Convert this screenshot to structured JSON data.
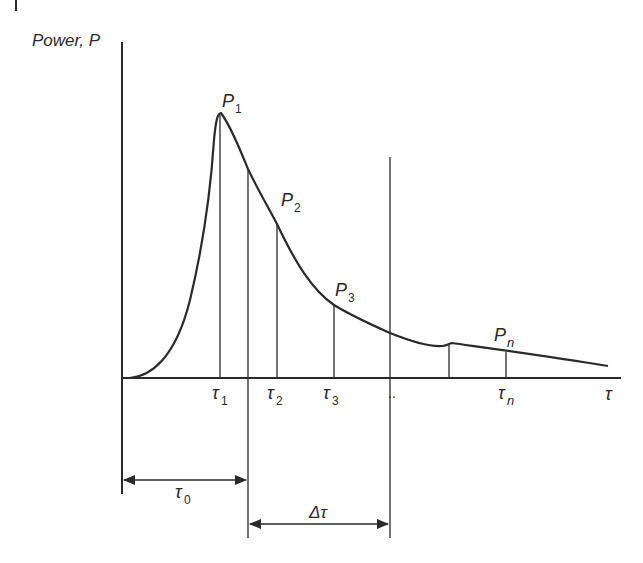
{
  "figure": {
    "y_axis_label": "Power, P",
    "x_axis_label": "τ",
    "peak_labels": [
      {
        "main": "P",
        "sub": "1"
      },
      {
        "main": "P",
        "sub": "2"
      },
      {
        "main": "P",
        "sub": "3"
      },
      {
        "main": "P",
        "sub": "n"
      }
    ],
    "tick_labels": [
      {
        "main": "τ",
        "sub": "1"
      },
      {
        "main": "τ",
        "sub": "2"
      },
      {
        "main": "τ",
        "sub": "3"
      },
      {
        "main": "..",
        "sub": ""
      },
      {
        "main": "τ",
        "sub": "n"
      }
    ],
    "intervals": [
      {
        "main": "τ",
        "sub": "0"
      },
      {
        "main": "Δτ",
        "sub": ""
      }
    ],
    "line_color": "#2a2a2a"
  }
}
